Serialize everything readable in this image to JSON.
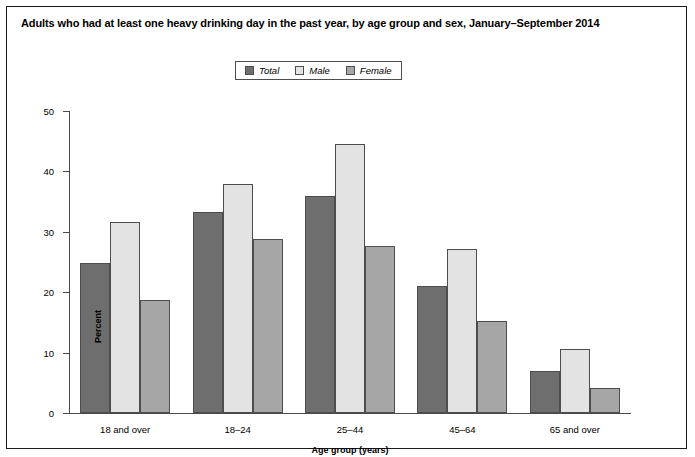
{
  "figure": {
    "title": "Adults who had at least one heavy drinking day in the past year, by age group and sex, January–September 2014"
  },
  "legend": {
    "position": "top-center",
    "entries": [
      {
        "label": "Total",
        "color": "#6e6e6e"
      },
      {
        "label": "Male",
        "color": "#e3e3e3"
      },
      {
        "label": "Female",
        "color": "#a6a6a6"
      }
    ]
  },
  "axes": {
    "y_title": "Percent",
    "x_title": "Age group (years)",
    "y_ticks": [
      "0",
      "10",
      "20",
      "30",
      "40",
      "50"
    ]
  },
  "chart_data": {
    "type": "bar",
    "title": "Adults who had at least one heavy drinking day in the past year, by age group and sex, January–September 2014",
    "xlabel": "Age group (years)",
    "ylabel": "Percent",
    "ylim": [
      0,
      50
    ],
    "ytick_interval": 10,
    "grid": false,
    "legend_position": "top-center",
    "categories": [
      "18 and over",
      "18–24",
      "25–44",
      "45–64",
      "65 and over"
    ],
    "series": [
      {
        "name": "Total",
        "color": "#6e6e6e",
        "values": [
          24.9,
          33.3,
          36.0,
          21.1,
          7.0
        ]
      },
      {
        "name": "Male",
        "color": "#e3e3e3",
        "values": [
          31.7,
          37.9,
          44.6,
          27.2,
          10.6
        ]
      },
      {
        "name": "Female",
        "color": "#a6a6a6",
        "values": [
          18.7,
          28.8,
          27.7,
          15.3,
          4.1
        ]
      }
    ]
  }
}
